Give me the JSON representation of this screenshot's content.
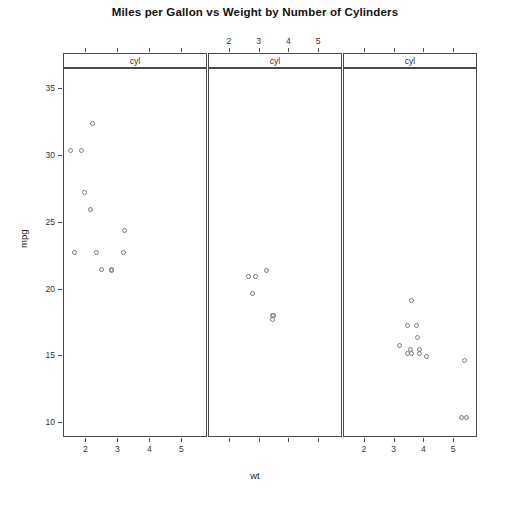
{
  "chart_data": {
    "type": "scatter",
    "title": "Miles per Gallon vs Weight by Number of Cylinders",
    "xlabel": "wt",
    "ylabel": "mpg",
    "xlim": [
      1.3,
      5.8
    ],
    "ylim": [
      8.9,
      36.5
    ],
    "grid": false,
    "legend": null,
    "conditioning_variable": "cyl",
    "panel_strip_label": "cyl",
    "x_ticks": [
      2,
      3,
      4,
      5
    ],
    "x_tick_labels": [
      "2",
      "3",
      "4",
      "5"
    ],
    "y_ticks": [
      10,
      15,
      20,
      25,
      30,
      35
    ],
    "y_tick_labels": [
      "10",
      "15",
      "20",
      "25",
      "30",
      "35"
    ],
    "panels": [
      {
        "index": 0,
        "strip_label": "cyl",
        "cyl": 4,
        "x_axis_position": "bottom",
        "x": [
          2.32,
          3.19,
          1.615,
          1.835,
          2.465,
          1.935,
          2.14,
          1.513,
          2.2,
          2.78,
          3.15,
          2.77
        ],
        "y": [
          22.8,
          24.4,
          22.8,
          30.4,
          21.5,
          27.3,
          26.0,
          30.4,
          32.4,
          21.4,
          22.8,
          21.5
        ],
        "n": 12
      },
      {
        "index": 1,
        "strip_label": "cyl",
        "cyl": 6,
        "x_axis_position": "top",
        "x": [
          2.62,
          2.875,
          3.215,
          3.44,
          3.46,
          3.44,
          2.77
        ],
        "y": [
          21.0,
          21.0,
          21.4,
          18.1,
          18.1,
          17.8,
          19.7
        ],
        "n": 7
      },
      {
        "index": 2,
        "strip_label": "cyl",
        "cyl": 8,
        "x_axis_position": "bottom",
        "x": [
          3.44,
          3.57,
          4.07,
          3.73,
          3.78,
          5.25,
          5.424,
          5.345,
          3.52,
          3.435,
          3.84,
          3.845,
          3.17,
          3.57
        ],
        "y": [
          17.3,
          15.2,
          15.0,
          17.3,
          16.4,
          10.4,
          10.4,
          14.7,
          15.5,
          15.2,
          15.5,
          15.2,
          15.8,
          19.2
        ],
        "n": 14
      }
    ]
  },
  "figure": {
    "title": "Miles per Gallon vs Weight by Number of Cylinders",
    "x_axis_title": "wt",
    "y_axis_title": "mpg"
  }
}
